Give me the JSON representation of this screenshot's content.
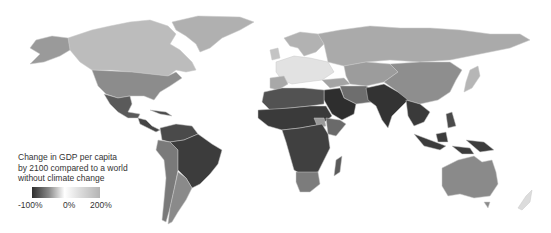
{
  "legend": {
    "title_lines": [
      "Change in GDP per capita",
      "by 2100 compared to a world",
      "without climate change"
    ],
    "ticks": [
      "-100%",
      "0%",
      "200%"
    ],
    "gradient": {
      "low": "#2e2e2e",
      "mid": "#ffffff",
      "high": "#b4b4b4"
    }
  },
  "map": {
    "background": "#ffffff",
    "regions": [
      {
        "name": "Greenland",
        "shade": "#b0b0b0"
      },
      {
        "name": "Canada",
        "shade": "#bcbcbc"
      },
      {
        "name": "Alaska",
        "shade": "#9a9a9a"
      },
      {
        "name": "United States",
        "shade": "#8c8c8c"
      },
      {
        "name": "Mexico",
        "shade": "#5a5a5a"
      },
      {
        "name": "Central America",
        "shade": "#454545"
      },
      {
        "name": "Northern South America",
        "shade": "#4a4a4a"
      },
      {
        "name": "Brazil",
        "shade": "#3c3c3c"
      },
      {
        "name": "Andes",
        "shade": "#7a7a7a"
      },
      {
        "name": "Argentina",
        "shade": "#8a8a8a"
      },
      {
        "name": "Northern Europe",
        "shade": "#b2b2b2"
      },
      {
        "name": "Central Europe",
        "shade": "#e2e2e2"
      },
      {
        "name": "Russia",
        "shade": "#aaaaaa"
      },
      {
        "name": "Central Asia",
        "shade": "#9c9c9c"
      },
      {
        "name": "China",
        "shade": "#8e8e8e"
      },
      {
        "name": "North Africa",
        "shade": "#525252"
      },
      {
        "name": "Sahel",
        "shade": "#3a3a3a"
      },
      {
        "name": "Central Africa",
        "shade": "#404040"
      },
      {
        "name": "South Africa",
        "shade": "#7c7c7c"
      },
      {
        "name": "Madagascar",
        "shade": "#5a5a5a"
      },
      {
        "name": "Arabia",
        "shade": "#2e2e2e"
      },
      {
        "name": "Iran",
        "shade": "#6e6e6e"
      },
      {
        "name": "India",
        "shade": "#333333"
      },
      {
        "name": "Southeast Asia",
        "shade": "#3a3a3a"
      },
      {
        "name": "Indonesia",
        "shade": "#3c3c3c"
      },
      {
        "name": "Japan",
        "shade": "#b6b6b6"
      },
      {
        "name": "Australia",
        "shade": "#8a8a8a"
      },
      {
        "name": "New Zealand",
        "shade": "#dcdcdc"
      }
    ]
  }
}
